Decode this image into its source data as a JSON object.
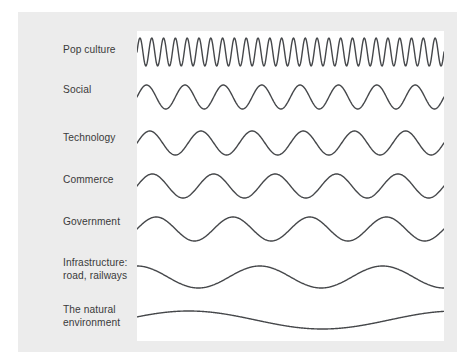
{
  "figure": {
    "title": "",
    "background_color": "#ffffff",
    "panel_color": "#ececec",
    "plot_background_color": "#ffffff",
    "wave_color": "#45474a",
    "label_color": "#3a3a3a"
  },
  "rows": [
    {
      "label": "Pop culture",
      "label_y": 51,
      "line_count": 1
    },
    {
      "label": "Social",
      "label_y": 91,
      "line_count": 1
    },
    {
      "label": "Technology",
      "label_y": 139,
      "line_count": 1
    },
    {
      "label": "Commerce",
      "label_y": 181,
      "line_count": 1
    },
    {
      "label": "Government",
      "label_y": 223,
      "line_count": 1
    },
    {
      "label": "Infrastructure:\nroad, railways",
      "label_y": 264,
      "line_count": 2
    },
    {
      "label": "The natural\nenvironment",
      "label_y": 311,
      "line_count": 2
    }
  ],
  "chart_data": {
    "type": "line",
    "title": "",
    "xlabel": "",
    "ylabel": "",
    "x_range": [
      0,
      307
    ],
    "categories": [
      "Pop culture",
      "Social",
      "Technology",
      "Commerce",
      "Government",
      "Infrastructure: road, railways",
      "The natural environment"
    ],
    "series": [
      {
        "name": "Pop culture",
        "cycles": 26,
        "amplitude": 14,
        "baseline_y": 52,
        "phase": 0,
        "stroke_width": 1.4
      },
      {
        "name": "Social",
        "cycles": 8,
        "amplitude": 12,
        "baseline_y": 97,
        "phase": 0,
        "stroke_width": 1.4
      },
      {
        "name": "Technology",
        "cycles": 6,
        "amplitude": 12,
        "baseline_y": 143,
        "phase": 0,
        "stroke_width": 1.4
      },
      {
        "name": "Commerce",
        "cycles": 5,
        "amplitude": 12,
        "baseline_y": 186,
        "phase": 0,
        "stroke_width": 1.4
      },
      {
        "name": "Government",
        "cycles": 4,
        "amplitude": 12,
        "baseline_y": 229,
        "phase": 0,
        "stroke_width": 1.4
      },
      {
        "name": "Infrastructure: road, railways",
        "cycles": 2.5,
        "amplitude": 11,
        "baseline_y": 277,
        "phase": 1.5707963,
        "stroke_width": 1.4
      },
      {
        "name": "The natural environment",
        "cycles": 1.15,
        "amplitude": 9,
        "baseline_y": 320,
        "phase": 0.35,
        "stroke_width": 1.4
      }
    ],
    "grid": false,
    "legend": "none"
  }
}
